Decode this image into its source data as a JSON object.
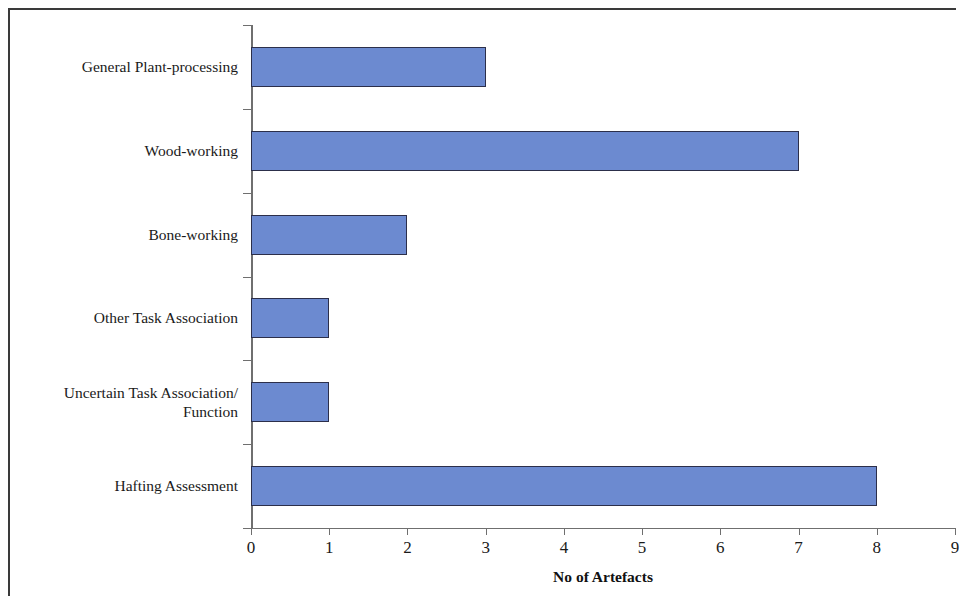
{
  "chart_data": {
    "type": "bar",
    "orientation": "horizontal",
    "title": "",
    "xlabel": "No of Artefacts",
    "ylabel": "",
    "categories": [
      "General Plant-processing",
      "Wood-working",
      "Bone-working",
      "Other Task Association",
      "Uncertain Task Association/\nFunction",
      "Hafting Assessment"
    ],
    "values": [
      3,
      7,
      2,
      1,
      1,
      8
    ],
    "xlim": [
      0,
      9
    ],
    "xticks": [
      "0",
      "1",
      "2",
      "3",
      "4",
      "5",
      "6",
      "7",
      "8",
      "9"
    ],
    "grid": false,
    "legend": null,
    "bar_color": "#6C8AD0",
    "bar_border_color": "#2C2F4A",
    "axis_color": "#6F6F6F",
    "frame_color": "#3A3A3A"
  }
}
